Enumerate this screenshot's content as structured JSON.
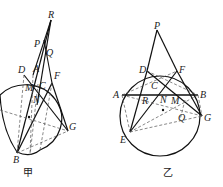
{
  "figures": [
    {
      "caption": "甲",
      "points": {
        "R": "R",
        "P": "P",
        "Q": "Q",
        "D": "D",
        "A": "A",
        "F": "F",
        "M": "M",
        "C": "C",
        "N": "N",
        "G": "G",
        "B": "B"
      }
    },
    {
      "caption": "乙",
      "points": {
        "P": "P",
        "D": "D",
        "F": "F",
        "C": "C",
        "A": "A",
        "B": "B",
        "R": "R",
        "N": "N",
        "M": "M",
        "Q": "Q",
        "G": "G",
        "E": "E"
      }
    }
  ]
}
